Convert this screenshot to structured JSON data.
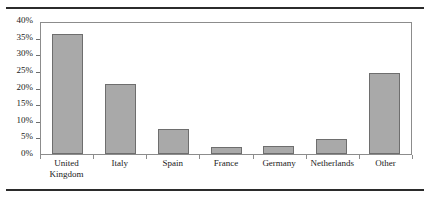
{
  "figure": {
    "top_rule": "horizontal-rule",
    "bottom_rule": "horizontal-rule"
  },
  "chart_data": {
    "type": "bar",
    "title": "",
    "subtitle": "",
    "xlabel": "",
    "ylabel": "",
    "categories": [
      "United Kingdom",
      "Italy",
      "Spain",
      "France",
      "Germany",
      "Netherlands",
      "Other"
    ],
    "category_lines": [
      [
        "United",
        "Kingdom"
      ],
      [
        "Italy"
      ],
      [
        "Spain"
      ],
      [
        "France"
      ],
      [
        "Germany"
      ],
      [
        "Netherlands"
      ],
      [
        "Other"
      ]
    ],
    "values": [
      36,
      21,
      7.5,
      2,
      2.5,
      4.5,
      24.5
    ],
    "value_unit": "%",
    "ylim": [
      0,
      40
    ],
    "ytick_values": [
      0,
      5,
      10,
      15,
      20,
      25,
      30,
      35,
      40
    ],
    "ytick_labels": [
      "0%",
      "5%",
      "10%",
      "15%",
      "20%",
      "25%",
      "30%",
      "35%",
      "40%"
    ],
    "grid": false,
    "legend": null,
    "legend_position": "none",
    "bar_fill_color": "#a9a9a9",
    "bar_border_color": "#6e6e6e",
    "plot_border_color": "#8c8c8c",
    "background_color": "#ffffff"
  }
}
